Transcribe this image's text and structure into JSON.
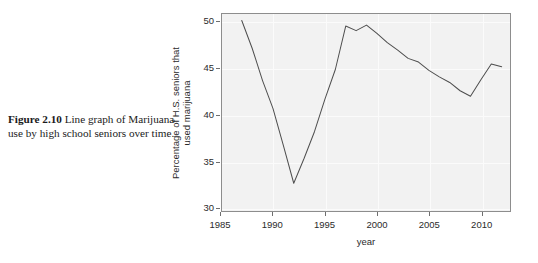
{
  "caption": {
    "figure_number": "Figure 2.10",
    "text": "Line graph of Marijuana use by high school seniors over time."
  },
  "colors": {
    "panel_background": "#f2f2f2",
    "panel_border": "#8d8d8d",
    "gridline": "#fbfbfb",
    "line": "#4d4d4d",
    "text": "#2b2b2b",
    "page_background": "#ffffff"
  },
  "chart_data": {
    "type": "line",
    "title": "",
    "subtitle": "",
    "xlabel": "year",
    "ylabel": "Percentage of H.S. seniors that used marijuana",
    "ylabel_line1": "Percentage of H.S. seniors that",
    "ylabel_line2": "used marijuana",
    "xlim": [
      1985.1,
      2012.8
    ],
    "ylim": [
      29.6,
      50.9
    ],
    "xticks": [
      1985,
      1990,
      1995,
      2000,
      2005,
      2010
    ],
    "xtick_labels": [
      "1985",
      "1990",
      "1995",
      "2000",
      "2005",
      "2010"
    ],
    "yticks": [
      30,
      35,
      40,
      45,
      50
    ],
    "ytick_labels": [
      "30",
      "35",
      "40",
      "45",
      "50"
    ],
    "grid": true,
    "grid_axis": "both",
    "legend": false,
    "legend_position": "none",
    "markers": false,
    "series": [
      {
        "name": "Percentage of H.S. seniors that used marijuana",
        "color": "#4d4d4d",
        "x": [
          1987,
          1988,
          1989,
          1990,
          1991,
          1992,
          1993,
          1994,
          1995,
          1996,
          1997,
          1998,
          1999,
          2000,
          2001,
          2002,
          2003,
          2004,
          2005,
          2006,
          2007,
          2008,
          2009,
          2010,
          2011,
          2012
        ],
        "y": [
          50.2,
          47.2,
          43.7,
          40.7,
          36.7,
          32.6,
          35.3,
          38.2,
          41.7,
          44.9,
          49.6,
          49.1,
          49.7,
          48.8,
          47.8,
          47.0,
          46.1,
          45.7,
          44.8,
          44.1,
          43.5,
          42.6,
          42.0,
          43.8,
          45.5,
          45.2
        ]
      }
    ]
  }
}
